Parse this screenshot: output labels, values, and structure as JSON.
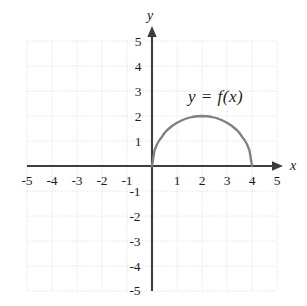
{
  "chart_data": {
    "type": "line",
    "title": "",
    "xlabel": "x",
    "ylabel": "y",
    "xlim": [
      -5,
      5
    ],
    "ylim": [
      -5,
      5
    ],
    "grid": true,
    "legend": "none",
    "annotations": [
      {
        "text": "y = f(x)",
        "x": 2.4,
        "y": 3.0
      }
    ],
    "x_ticks": [
      "-5",
      "-4",
      "-3",
      "-2",
      "-1",
      "1",
      "2",
      "3",
      "4",
      "5"
    ],
    "x_tick_values": [
      -5,
      -4,
      -3,
      -2,
      -1,
      1,
      2,
      3,
      4,
      5
    ],
    "y_ticks": [
      "5",
      "4",
      "3",
      "2",
      "1",
      "-1",
      "-2",
      "-3",
      "-4",
      "-5"
    ],
    "y_tick_values": [
      5,
      4,
      3,
      2,
      1,
      -1,
      -2,
      -3,
      -4,
      -5
    ],
    "series": [
      {
        "name": "y = f(x)",
        "description": "upper semicircle of radius 2 centered at (2,0)",
        "color": "#807f84",
        "x": [
          0.0,
          0.1,
          0.2,
          0.3,
          0.4,
          0.5,
          0.6,
          0.8,
          1.0,
          1.2,
          1.4,
          1.6,
          1.8,
          2.0,
          2.2,
          2.4,
          2.6,
          2.8,
          3.0,
          3.2,
          3.4,
          3.5,
          3.6,
          3.7,
          3.8,
          3.9,
          4.0
        ],
        "y": [
          0.0,
          0.62,
          0.87,
          1.04,
          1.17,
          1.32,
          1.43,
          1.6,
          1.73,
          1.83,
          1.91,
          1.96,
          1.99,
          2.0,
          1.99,
          1.96,
          1.91,
          1.83,
          1.73,
          1.6,
          1.43,
          1.32,
          1.17,
          1.04,
          0.87,
          0.62,
          0.0
        ]
      }
    ]
  },
  "axes": {
    "x_axis_name": "x",
    "y_axis_name": "y"
  },
  "colors": {
    "curve": "#807f84",
    "axis": "#3d3d3d",
    "grid": "#dcdcdc",
    "text": "#1c1c1c",
    "background": "#ffffff"
  }
}
